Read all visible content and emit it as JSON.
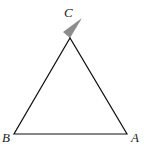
{
  "diagram": {
    "type": "triangle",
    "vertices": [
      {
        "label": "A",
        "x": 127,
        "y": 134,
        "label_x": 131,
        "label_y": 142
      },
      {
        "label": "B",
        "x": 14,
        "y": 134,
        "label_x": 2,
        "label_y": 142
      },
      {
        "label": "C",
        "x": 70,
        "y": 38,
        "label_x": 64,
        "label_y": 17
      }
    ],
    "marker": {
      "name": "angle-arrow-at-C",
      "color": "#8c8c8c",
      "points": "70,38 63,32 82,18"
    },
    "colors": {
      "stroke": "#111111",
      "background": "#ffffff",
      "label": "#222222"
    }
  }
}
